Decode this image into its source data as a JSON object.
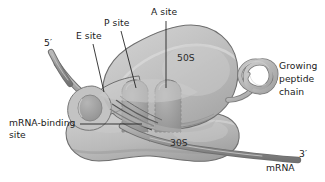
{
  "figure": {
    "background": "#ffffff",
    "line_color": "#1a1a1a"
  },
  "colors": {
    "large_subunit_50s": "#bdbdbd",
    "large_subunit_50s_shadow": "#a6a6a6",
    "small_subunit_30s": "#bcbcbc",
    "small_subunit_30s_shadow": "#a3a3a3",
    "site_pocket": "#a8a8a8",
    "site_pocket_edge": "#8c8c8c",
    "mrna_strand": "#9a9a9a",
    "mrna_strand_edge": "#6f6f6f",
    "peptide_chain": "#b4b4b4",
    "peptide_chain_edge": "#7a7a7a",
    "leader_line": "#1a1a1a",
    "text": "#1a1a1a"
  },
  "labels": {
    "a_site": "A site",
    "p_site": "P site",
    "e_site": "E site",
    "five_prime": "5′",
    "three_prime": "3′",
    "mrna_binding_site_line1": "mRNA-binding",
    "mrna_binding_site_line2": "site",
    "growing_peptide_line1": "Growing",
    "growing_peptide_line2": "peptide",
    "growing_peptide_line3": "chain",
    "mrna": "mRNA",
    "large_subunit": "50S",
    "small_subunit": "30S"
  },
  "diagram_parts": [
    {
      "name": "large-subunit-50s",
      "label": "50S",
      "description": "large ribosomal subunit, upper lobe"
    },
    {
      "name": "small-subunit-30s",
      "label": "30S",
      "description": "small ribosomal subunit, lower lobe"
    },
    {
      "name": "a-site-pocket",
      "label": "A site",
      "description": "aminoacyl tRNA binding pocket, rightmost"
    },
    {
      "name": "p-site-pocket",
      "label": "P site",
      "description": "peptidyl tRNA binding pocket, center"
    },
    {
      "name": "e-site-pocket",
      "label": "E site",
      "description": "exit tRNA binding pocket, leftmost"
    },
    {
      "name": "mrna-strand",
      "label": "mRNA",
      "description": "messenger RNA threading 5′ to 3′ through the small subunit"
    },
    {
      "name": "growing-peptide-chain",
      "label": "Growing peptide chain",
      "description": "coiled polypeptide emerging from exit tunnel"
    },
    {
      "name": "mrna-binding-site",
      "label": "mRNA-binding site",
      "description": "cleft between subunits where mRNA binds"
    }
  ]
}
